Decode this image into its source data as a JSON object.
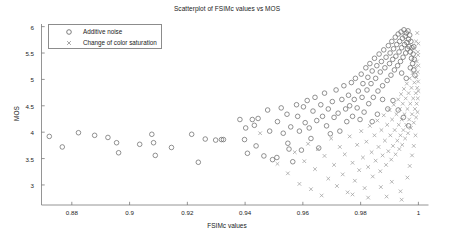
{
  "chart_data": {
    "type": "scatter",
    "title": "Scatterplot of FSIMc values vs MOS",
    "xlabel": "FSIMc values",
    "ylabel": "MOS",
    "xlim": [
      0.8695,
      1.0035
    ],
    "ylim": [
      2.62,
      6.05
    ],
    "xticks": [
      0.88,
      0.9,
      0.92,
      0.94,
      0.96,
      0.98,
      1
    ],
    "xticklabels": [
      "0.88",
      "0.9",
      "0.92",
      "0.94",
      "0.96",
      "0.98",
      "1"
    ],
    "yticks": [
      3,
      3.5,
      4,
      4.5,
      5,
      5.5,
      6
    ],
    "yticklabels": [
      "3",
      "3.5",
      "4",
      "4.5",
      "5",
      "5.5",
      "6"
    ],
    "grid": false,
    "legend_position": "upper-left",
    "series": [
      {
        "name": "Additive noise",
        "marker": "circle",
        "color": "#6e6e6e",
        "points": [
          [
            0.8722,
            3.92
          ],
          [
            0.8767,
            3.72
          ],
          [
            0.8823,
            3.99
          ],
          [
            0.8879,
            3.94
          ],
          [
            0.8925,
            3.9
          ],
          [
            0.8955,
            3.8
          ],
          [
            0.8962,
            3.61
          ],
          [
            0.9035,
            3.77
          ],
          [
            0.9077,
            3.96
          ],
          [
            0.9083,
            3.8
          ],
          [
            0.9089,
            3.56
          ],
          [
            0.9145,
            3.71
          ],
          [
            0.9215,
            3.96
          ],
          [
            0.9262,
            3.87
          ],
          [
            0.9238,
            3.43
          ],
          [
            0.9298,
            3.85
          ],
          [
            0.9318,
            3.86
          ],
          [
            0.9325,
            3.86
          ],
          [
            0.9382,
            4.24
          ],
          [
            0.9398,
            3.86
          ],
          [
            0.9402,
            4.08
          ],
          [
            0.9425,
            4.24
          ],
          [
            0.9432,
            4.13
          ],
          [
            0.9445,
            4.26
          ],
          [
            0.9438,
            3.74
          ],
          [
            0.9408,
            3.6
          ],
          [
            0.9465,
            3.55
          ],
          [
            0.9478,
            4.42
          ],
          [
            0.9485,
            4.02
          ],
          [
            0.9495,
            3.48
          ],
          [
            0.951,
            3.52
          ],
          [
            0.9512,
            4.2
          ],
          [
            0.9525,
            4.46
          ],
          [
            0.9532,
            3.98
          ],
          [
            0.9545,
            4.34
          ],
          [
            0.9548,
            3.79
          ],
          [
            0.9552,
            3.68
          ],
          [
            0.9558,
            4.1
          ],
          [
            0.9565,
            3.44
          ],
          [
            0.9578,
            4.52
          ],
          [
            0.9582,
            4.3
          ],
          [
            0.9588,
            4.02
          ],
          [
            0.9595,
            3.66
          ],
          [
            0.9602,
            4.48
          ],
          [
            0.9608,
            4.18
          ],
          [
            0.9615,
            4.6
          ],
          [
            0.9622,
            4.08
          ],
          [
            0.9628,
            3.88
          ],
          [
            0.9635,
            4.4
          ],
          [
            0.9642,
            4.66
          ],
          [
            0.9648,
            4.22
          ],
          [
            0.9655,
            3.7
          ],
          [
            0.9662,
            4.52
          ],
          [
            0.9668,
            4.3
          ],
          [
            0.9675,
            4.74
          ],
          [
            0.9682,
            4.12
          ],
          [
            0.9688,
            4.44
          ],
          [
            0.9695,
            3.97
          ],
          [
            0.9702,
            4.58
          ],
          [
            0.9708,
            4.28
          ],
          [
            0.9715,
            4.8
          ],
          [
            0.9722,
            4.36
          ],
          [
            0.9728,
            4.02
          ],
          [
            0.9735,
            4.62
          ],
          [
            0.9742,
            4.88
          ],
          [
            0.9748,
            4.44
          ],
          [
            0.9752,
            4.2
          ],
          [
            0.9758,
            4.7
          ],
          [
            0.9762,
            4.5
          ],
          [
            0.9768,
            4.94
          ],
          [
            0.9772,
            4.3
          ],
          [
            0.9778,
            4.62
          ],
          [
            0.9782,
            5.02
          ],
          [
            0.9788,
            4.46
          ],
          [
            0.9792,
            4.78
          ],
          [
            0.9798,
            4.24
          ],
          [
            0.9802,
            5.1
          ],
          [
            0.9805,
            4.66
          ],
          [
            0.9808,
            4.92
          ],
          [
            0.9812,
            4.38
          ],
          [
            0.9818,
            5.22
          ],
          [
            0.9822,
            4.8
          ],
          [
            0.9825,
            5.04
          ],
          [
            0.9828,
            4.54
          ],
          [
            0.9832,
            5.3
          ],
          [
            0.9836,
            4.92
          ],
          [
            0.984,
            5.16
          ],
          [
            0.9844,
            4.66
          ],
          [
            0.9848,
            5.4
          ],
          [
            0.9852,
            5.02
          ],
          [
            0.9856,
            5.26
          ],
          [
            0.986,
            4.78
          ],
          [
            0.9864,
            5.48
          ],
          [
            0.9868,
            5.14
          ],
          [
            0.9872,
            5.34
          ],
          [
            0.9876,
            4.88
          ],
          [
            0.988,
            5.56
          ],
          [
            0.9884,
            5.22
          ],
          [
            0.9888,
            5.42
          ],
          [
            0.9892,
            4.98
          ],
          [
            0.9896,
            5.64
          ],
          [
            0.99,
            5.3
          ],
          [
            0.9902,
            5.5
          ],
          [
            0.9905,
            5.08
          ],
          [
            0.9908,
            5.72
          ],
          [
            0.9911,
            5.38
          ],
          [
            0.9914,
            5.58
          ],
          [
            0.9917,
            5.18
          ],
          [
            0.992,
            5.8
          ],
          [
            0.9922,
            5.44
          ],
          [
            0.9925,
            5.66
          ],
          [
            0.9928,
            5.26
          ],
          [
            0.993,
            5.86
          ],
          [
            0.9933,
            5.52
          ],
          [
            0.9935,
            5.72
          ],
          [
            0.9938,
            5.34
          ],
          [
            0.994,
            5.9
          ],
          [
            0.9942,
            5.6
          ],
          [
            0.9945,
            5.78
          ],
          [
            0.9947,
            5.42
          ],
          [
            0.995,
            5.94
          ],
          [
            0.9952,
            5.66
          ],
          [
            0.9954,
            5.82
          ],
          [
            0.9956,
            5.5
          ],
          [
            0.9958,
            5.88
          ],
          [
            0.996,
            5.7
          ],
          [
            0.9962,
            5.58
          ],
          [
            0.9964,
            5.92
          ],
          [
            0.9966,
            5.76
          ],
          [
            0.9968,
            5.62
          ],
          [
            0.997,
            5.84
          ],
          [
            0.9972,
            5.52
          ],
          [
            0.9974,
            5.72
          ],
          [
            0.9976,
            5.4
          ],
          [
            0.9978,
            5.6
          ],
          [
            0.998,
            5.3
          ],
          [
            0.9982,
            5.48
          ],
          [
            0.9984,
            5.18
          ],
          [
            0.9986,
            5.38
          ],
          [
            0.9988,
            5.08
          ],
          [
            0.9912,
            4.6
          ],
          [
            0.993,
            4.42
          ],
          [
            0.9948,
            4.28
          ],
          [
            0.9966,
            4.12
          ],
          [
            0.9876,
            4.62
          ],
          [
            0.9894,
            4.44
          ],
          [
            0.9858,
            4.34
          ],
          [
            0.984,
            4.2
          ],
          [
            0.9942,
            5.12
          ],
          [
            0.9958,
            5.02
          ],
          [
            0.9972,
            5.22
          ],
          [
            0.9984,
            5.62
          ]
        ]
      },
      {
        "name": "Change of color saturation",
        "marker": "x",
        "color": "#9a9a9a",
        "points": [
          [
            0.9452,
            3.98
          ],
          [
            0.9512,
            3.4
          ],
          [
            0.9548,
            3.22
          ],
          [
            0.9572,
            3.62
          ],
          [
            0.9588,
            3.02
          ],
          [
            0.9605,
            3.45
          ],
          [
            0.9618,
            3.78
          ],
          [
            0.9628,
            2.92
          ],
          [
            0.9642,
            3.3
          ],
          [
            0.9652,
            3.68
          ],
          [
            0.9665,
            2.8
          ],
          [
            0.9675,
            3.55
          ],
          [
            0.9688,
            3.12
          ],
          [
            0.9698,
            3.88
          ],
          [
            0.9708,
            3.38
          ],
          [
            0.9718,
            2.98
          ],
          [
            0.9728,
            3.72
          ],
          [
            0.9738,
            3.2
          ],
          [
            0.9745,
            3.58
          ],
          [
            0.9755,
            2.86
          ],
          [
            0.9762,
            3.92
          ],
          [
            0.9772,
            3.42
          ],
          [
            0.978,
            3.08
          ],
          [
            0.9788,
            3.76
          ],
          [
            0.9795,
            3.28
          ],
          [
            0.9802,
            4.02
          ],
          [
            0.9808,
            3.52
          ],
          [
            0.9814,
            2.94
          ],
          [
            0.982,
            3.82
          ],
          [
            0.9826,
            3.34
          ],
          [
            0.9832,
            4.12
          ],
          [
            0.9838,
            3.62
          ],
          [
            0.9842,
            3.16
          ],
          [
            0.9848,
            3.94
          ],
          [
            0.9852,
            3.46
          ],
          [
            0.9858,
            4.22
          ],
          [
            0.9862,
            3.72
          ],
          [
            0.9868,
            3.26
          ],
          [
            0.9872,
            4.04
          ],
          [
            0.9876,
            3.56
          ],
          [
            0.988,
            4.32
          ],
          [
            0.9884,
            3.84
          ],
          [
            0.9888,
            3.38
          ],
          [
            0.9892,
            4.14
          ],
          [
            0.9896,
            3.64
          ],
          [
            0.99,
            4.42
          ],
          [
            0.9903,
            3.94
          ],
          [
            0.9906,
            3.48
          ],
          [
            0.9909,
            4.24
          ],
          [
            0.9912,
            3.74
          ],
          [
            0.9915,
            4.52
          ],
          [
            0.9918,
            4.04
          ],
          [
            0.9921,
            3.58
          ],
          [
            0.9924,
            4.34
          ],
          [
            0.9927,
            3.84
          ],
          [
            0.993,
            4.62
          ],
          [
            0.9932,
            4.14
          ],
          [
            0.9934,
            3.68
          ],
          [
            0.9936,
            4.44
          ],
          [
            0.9938,
            3.94
          ],
          [
            0.994,
            4.72
          ],
          [
            0.9942,
            4.24
          ],
          [
            0.9944,
            3.76
          ],
          [
            0.9946,
            4.54
          ],
          [
            0.9948,
            4.04
          ],
          [
            0.995,
            4.82
          ],
          [
            0.9952,
            4.34
          ],
          [
            0.9954,
            3.88
          ],
          [
            0.9956,
            4.64
          ],
          [
            0.9958,
            4.14
          ],
          [
            0.996,
            4.92
          ],
          [
            0.9962,
            4.44
          ],
          [
            0.9964,
            3.98
          ],
          [
            0.9966,
            4.74
          ],
          [
            0.9968,
            4.24
          ],
          [
            0.997,
            5.02
          ],
          [
            0.9972,
            4.54
          ],
          [
            0.9974,
            4.08
          ],
          [
            0.9976,
            4.84
          ],
          [
            0.9978,
            4.34
          ],
          [
            0.998,
            5.12
          ],
          [
            0.9982,
            4.64
          ],
          [
            0.9984,
            4.18
          ],
          [
            0.9986,
            4.94
          ],
          [
            0.9988,
            4.44
          ],
          [
            0.999,
            5.24
          ],
          [
            0.9991,
            4.74
          ],
          [
            0.9992,
            4.28
          ],
          [
            0.9993,
            5.04
          ],
          [
            0.9994,
            4.54
          ],
          [
            0.9995,
            5.34
          ],
          [
            0.9996,
            4.84
          ],
          [
            0.9997,
            4.38
          ],
          [
            0.9998,
            5.14
          ],
          [
            0.9998,
            4.64
          ],
          [
            0.9999,
            5.46
          ],
          [
            0.9999,
            4.96
          ],
          [
            1.0,
            5.68
          ],
          [
            1.0,
            5.26
          ],
          [
            1.0,
            4.78
          ],
          [
            0.9986,
            5.58
          ],
          [
            0.9992,
            5.72
          ],
          [
            0.9996,
            5.88
          ],
          [
            0.9998,
            5.52
          ],
          [
            0.9942,
            2.72
          ],
          [
            0.989,
            2.78
          ],
          [
            0.9938,
            2.88
          ],
          [
            0.9826,
            2.76
          ],
          [
            0.9772,
            2.82
          ],
          [
            0.987,
            2.96
          ],
          [
            0.9908,
            3.06
          ],
          [
            0.9962,
            3.14
          ],
          [
            0.997,
            3.36
          ],
          [
            0.9978,
            3.56
          ],
          [
            0.9984,
            3.74
          ],
          [
            0.999,
            3.94
          ]
        ]
      }
    ]
  }
}
